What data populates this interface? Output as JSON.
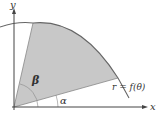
{
  "diagram": {
    "type": "polar-region",
    "axes": {
      "x_label": "x",
      "y_label": "y"
    },
    "curve_label": "r = f(θ)",
    "angles": {
      "alpha_label": "α",
      "beta_label": "β"
    },
    "colors": {
      "shaded_region": "#c8c8c8",
      "axis": "#444444",
      "curve": "#666666",
      "background": "#ffffff"
    }
  }
}
